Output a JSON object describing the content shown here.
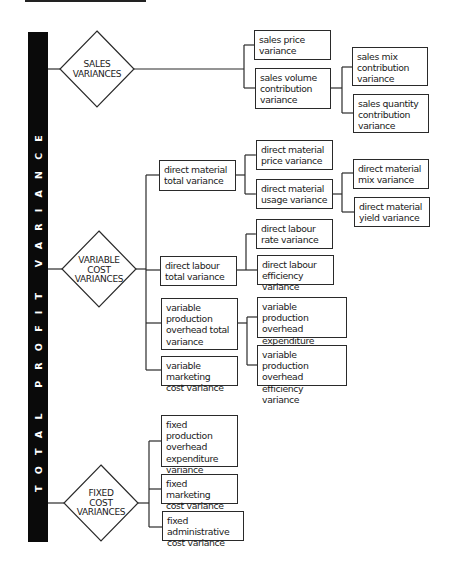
{
  "diagram": {
    "root_label": "TOTAL PROFIT VARIANCE",
    "groups": [
      {
        "label_lines": [
          "SALES",
          "VARIANCES"
        ],
        "children": [
          {
            "lines": [
              "sales price",
              "variance"
            ]
          },
          {
            "lines": [
              "sales volume",
              "contribution",
              "variance"
            ],
            "children": [
              {
                "lines": [
                  "sales mix",
                  "contribution",
                  "variance"
                ]
              },
              {
                "lines": [
                  "sales quantity",
                  "contribution",
                  "variance"
                ]
              }
            ]
          }
        ]
      },
      {
        "label_lines": [
          "VARIABLE",
          "COST",
          "VARIANCES"
        ],
        "children": [
          {
            "lines": [
              "direct material",
              "total variance"
            ],
            "children": [
              {
                "lines": [
                  "direct material",
                  "price variance"
                ]
              },
              {
                "lines": [
                  "direct material",
                  "usage variance"
                ],
                "children": [
                  {
                    "lines": [
                      "direct material",
                      "mix variance"
                    ]
                  },
                  {
                    "lines": [
                      "direct material",
                      "yield variance"
                    ]
                  }
                ]
              }
            ]
          },
          {
            "lines": [
              "direct labour",
              "total variance"
            ],
            "children": [
              {
                "lines": [
                  "direct labour",
                  "rate variance"
                ]
              },
              {
                "lines": [
                  "direct labour",
                  "efficiency variance"
                ]
              }
            ]
          },
          {
            "lines": [
              "variable",
              "production",
              "overhead total",
              "variance"
            ],
            "children": [
              {
                "lines": [
                  "variable production",
                  "overhead expenditure",
                  "variance"
                ]
              },
              {
                "lines": [
                  "variable production",
                  "overhead efficiency",
                  "variance"
                ]
              }
            ]
          },
          {
            "lines": [
              "variable marketing",
              "cost variance"
            ]
          }
        ]
      },
      {
        "label_lines": [
          "FIXED",
          "COST",
          "VARIANCES"
        ],
        "children": [
          {
            "lines": [
              "fixed production",
              "overhead",
              "expenditure",
              "variance"
            ]
          },
          {
            "lines": [
              "fixed marketing",
              "cost variance"
            ]
          },
          {
            "lines": [
              "fixed administrative",
              "cost variance"
            ]
          }
        ]
      }
    ]
  }
}
